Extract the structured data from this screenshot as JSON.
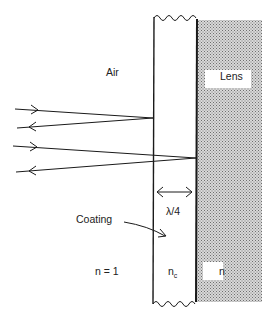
{
  "diagram": {
    "labels": {
      "air": "Air",
      "lens": "Lens",
      "coating": "Coating",
      "thickness": "λ/4",
      "n_air": "n = 1",
      "n_coating": "n",
      "n_coating_sub": "c",
      "n_lens": "n"
    },
    "regions": [
      {
        "name": "air",
        "index": "n = 1"
      },
      {
        "name": "coating",
        "index": "n_c",
        "thickness": "λ/4"
      },
      {
        "name": "lens",
        "index": "n"
      }
    ],
    "rays": [
      {
        "name": "incident-ray-1",
        "reflects_at": "air-coating interface"
      },
      {
        "name": "reflected-ray-1"
      },
      {
        "name": "incident-ray-2",
        "reflects_at": "coating-lens interface"
      },
      {
        "name": "reflected-ray-2"
      }
    ],
    "colors": {
      "line": "#1a1a1a",
      "stipple": "#9a9a9a",
      "background": "#ffffff"
    }
  }
}
